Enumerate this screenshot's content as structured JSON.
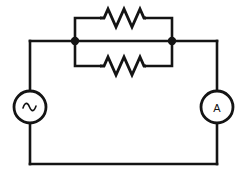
{
  "diagram": {
    "type": "electrical-schematic",
    "canvas": {
      "width": 246,
      "height": 178,
      "background": "#ffffff"
    },
    "line_color": "#141414",
    "line_width": 2.6
  },
  "components": {
    "source": {
      "kind": "ac-voltage-source",
      "symbol": "sine-wave",
      "label": "",
      "center_x": 30,
      "center_y": 107,
      "radius": 16
    },
    "ammeter": {
      "kind": "ammeter",
      "symbol": "A",
      "label": "A",
      "center_x": 217,
      "center_y": 107,
      "radius": 16
    },
    "resistor_top": {
      "kind": "resistor",
      "label": "",
      "x_start": 100,
      "x_end": 146,
      "y": 18,
      "peaks": 3
    },
    "resistor_bottom": {
      "kind": "resistor",
      "label": "",
      "x_start": 100,
      "x_end": 146,
      "y": 66,
      "peaks": 3
    }
  },
  "nodes": {
    "left_junction": {
      "x": 75,
      "y": 41,
      "radius": 4.2
    },
    "right_junction": {
      "x": 172,
      "y": 41,
      "radius": 4.2
    }
  },
  "wires": {
    "outer_loop": "M30,41 L30,91 M30,123 L30,164 L217,164 L217,123 M217,91 L217,41 L172,41 L75,41 L30,41",
    "top_branch": "M75,41 L75,18 L100,18 M146,18 L172,18 L172,41",
    "bottom_branch": "M75,41 L75,66 L100,66 M146,66 L172,66 L172,41"
  }
}
